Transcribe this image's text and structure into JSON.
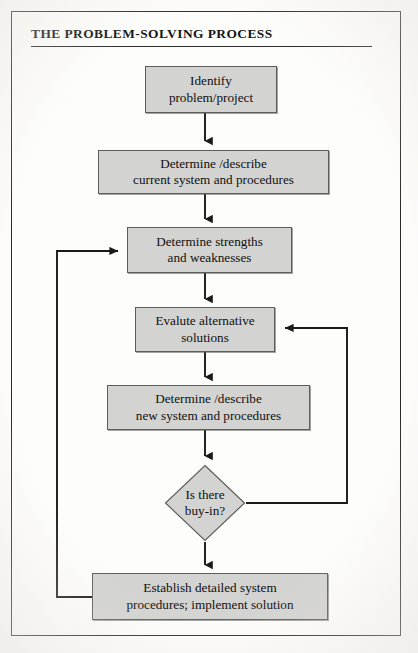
{
  "figure": {
    "title": "THE PROBLEM-SOLVING PROCESS",
    "type": "flowchart",
    "box_fill_color": "#d3d3d1",
    "box_border_color": "#5d5d5b",
    "line_color": "#1a1a1a",
    "text_color": "#101010"
  },
  "nodes": [
    {
      "id": "identify",
      "shape": "rectangle",
      "line1": "Identify",
      "line2": "problem/project"
    },
    {
      "id": "current",
      "shape": "rectangle",
      "line1": "Determine /describe",
      "line2": "current system and procedures"
    },
    {
      "id": "strengths",
      "shape": "rectangle",
      "line1": "Determine strengths",
      "line2": "and weaknesses"
    },
    {
      "id": "evaluate",
      "shape": "rectangle",
      "line1": "Evalute alternative",
      "line2": "solutions"
    },
    {
      "id": "newsystem",
      "shape": "rectangle",
      "line1": "Determine /describe",
      "line2": "new system and procedures"
    },
    {
      "id": "buyin",
      "shape": "diamond",
      "line1": "Is there",
      "line2": "buy-in?"
    },
    {
      "id": "establish",
      "shape": "rectangle",
      "line1": "Establish detailed system",
      "line2": "procedures; implement solution"
    }
  ],
  "edges": [
    {
      "from": "identify",
      "to": "current",
      "kind": "arrow-down"
    },
    {
      "from": "current",
      "to": "strengths",
      "kind": "arrow-down"
    },
    {
      "from": "strengths",
      "to": "evaluate",
      "kind": "arrow-down"
    },
    {
      "from": "evaluate",
      "to": "newsystem",
      "kind": "arrow-down"
    },
    {
      "from": "newsystem",
      "to": "buyin",
      "kind": "arrow-down"
    },
    {
      "from": "buyin",
      "to": "establish",
      "kind": "arrow-down"
    },
    {
      "from": "establish",
      "to": "strengths",
      "kind": "feedback-left"
    },
    {
      "from": "buyin",
      "to": "evaluate",
      "kind": "feedback-right"
    }
  ]
}
